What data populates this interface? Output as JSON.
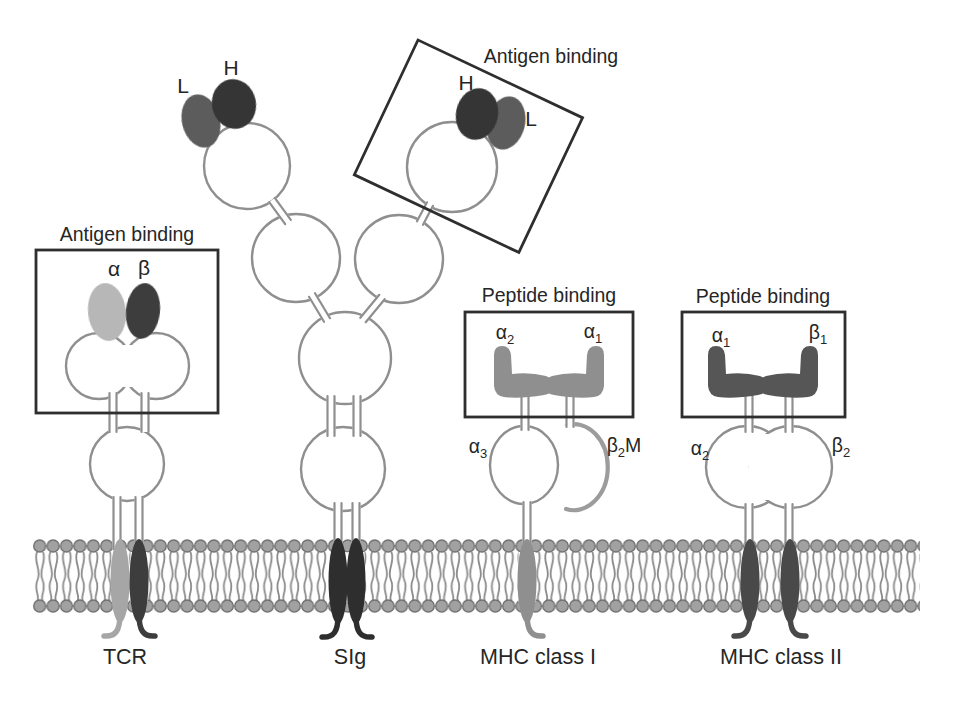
{
  "receptors": {
    "tcr": {
      "name": "TCR",
      "binding_site_title": "Antigen binding",
      "alpha_chain": "α",
      "beta_chain": "β"
    },
    "sig": {
      "name": "SIg",
      "binding_site_title": "Antigen binding",
      "left_arm": {
        "light": "L",
        "heavy": "H"
      },
      "right_arm": {
        "heavy": "H",
        "light": "L"
      }
    },
    "mhc1": {
      "name": "MHC class I",
      "binding_site_title": "Peptide binding",
      "alpha2": {
        "base": "α",
        "sub": "2"
      },
      "alpha1": {
        "base": "α",
        "sub": "1"
      },
      "alpha3": {
        "base": "α",
        "sub": "3"
      },
      "beta2m": {
        "base": "β",
        "sub": "2",
        "suffix": "M"
      }
    },
    "mhc2": {
      "name": "MHC class II",
      "binding_site_title": "Peptide binding",
      "alpha1": {
        "base": "α",
        "sub": "1"
      },
      "beta1": {
        "base": "β",
        "sub": "1"
      },
      "alpha2": {
        "base": "α",
        "sub": "2"
      },
      "beta2": {
        "base": "β",
        "sub": "2"
      }
    }
  },
  "colors": {
    "text": "#262626",
    "box_stroke": "#2e2e2e",
    "domain_outline": "#8f8f8f",
    "membrane_head": "#a1a1a1",
    "membrane_head_outline": "#707070",
    "membrane_tail": "#8b8b8b",
    "tcr_alpha": "#b7b7b7",
    "tcr_beta": "#3d3d3d",
    "tcr_tm_alpha": "#a6a6a6",
    "tcr_tm_beta": "#3d3d3d",
    "sig_light": "#5c5c5c",
    "sig_heavy": "#343434",
    "sig_tm": "#2f2f2f",
    "mhc1_binding_domain": "#8f8f8f",
    "mhc1_tm": "#8f8f8f",
    "mhc1_b2m": "#9c9c9c",
    "mhc2_binding_domain": "#575757",
    "mhc2_tm": "#484848"
  }
}
